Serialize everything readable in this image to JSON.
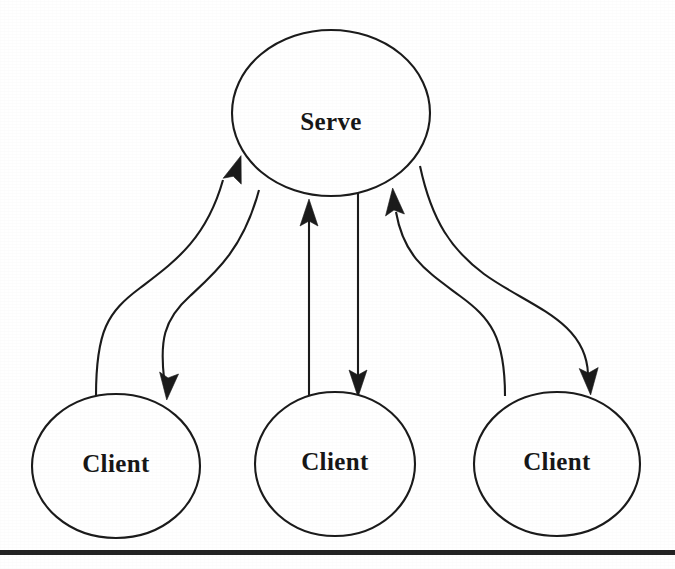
{
  "diagram": {
    "type": "client-server-architecture",
    "background_color": "#ffffff",
    "stroke_color": "#1b1b1b",
    "text_color": "#171717",
    "nodes": [
      {
        "id": "server",
        "label": "Serve",
        "shape": "ellipse",
        "cx": 331,
        "cy": 113,
        "rx": 99,
        "ry": 83
      },
      {
        "id": "client-left",
        "label": "Client",
        "shape": "ellipse",
        "cx": 116,
        "cy": 466,
        "rx": 84,
        "ry": 72
      },
      {
        "id": "client-middle",
        "label": "Client",
        "shape": "ellipse",
        "cx": 335,
        "cy": 464,
        "rx": 80,
        "ry": 72
      },
      {
        "id": "client-right",
        "label": "Client",
        "shape": "ellipse",
        "cx": 557,
        "cy": 464,
        "rx": 83,
        "ry": 72
      }
    ],
    "edges": [
      {
        "id": "edge-left-up",
        "from": "client-left",
        "to": "server",
        "style": "s-curve",
        "direction": "up",
        "arrow_at": {
          "x": 237,
          "y": 157
        }
      },
      {
        "id": "edge-left-down",
        "from": "server",
        "to": "client-left",
        "style": "s-curve",
        "direction": "down",
        "arrow_at": {
          "x": 168,
          "y": 396
        }
      },
      {
        "id": "edge-middle-up",
        "from": "client-middle",
        "to": "server",
        "style": "straight",
        "direction": "up",
        "arrow_at": {
          "x": 309,
          "y": 203
        }
      },
      {
        "id": "edge-middle-down",
        "from": "server",
        "to": "client-middle",
        "style": "straight",
        "direction": "down",
        "arrow_at": {
          "x": 358,
          "y": 393
        }
      },
      {
        "id": "edge-right-up",
        "from": "client-right",
        "to": "server",
        "style": "s-curve",
        "direction": "up",
        "arrow_at": {
          "x": 394,
          "y": 190
        }
      },
      {
        "id": "edge-right-down",
        "from": "server",
        "to": "client-right",
        "style": "s-curve",
        "direction": "down",
        "arrow_at": {
          "x": 590,
          "y": 390
        }
      }
    ],
    "footer_rule": {
      "y": 550,
      "height": 5,
      "color": "#232323"
    }
  }
}
